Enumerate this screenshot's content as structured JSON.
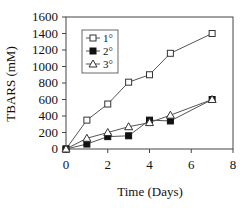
{
  "chart_data": {
    "type": "line",
    "title": "",
    "xlabel": "Time (Days)",
    "ylabel": "TBARS (mM)",
    "xlim": [
      0,
      8
    ],
    "ylim": [
      0,
      1600
    ],
    "xticks": [
      0,
      2,
      4,
      6,
      8
    ],
    "yticks": [
      0,
      200,
      400,
      600,
      800,
      1000,
      1200,
      1400,
      1600
    ],
    "grid": false,
    "legend_position": "upper-left-inside",
    "series": [
      {
        "name": "1°",
        "marker": "open-square",
        "x": [
          0,
          1,
          2,
          3,
          4,
          5,
          7
        ],
        "values": [
          0,
          350,
          545,
          810,
          900,
          1160,
          1400
        ]
      },
      {
        "name": "2°",
        "marker": "filled-square",
        "x": [
          0,
          1,
          2,
          3,
          4,
          5,
          7
        ],
        "values": [
          0,
          60,
          150,
          160,
          350,
          340,
          600
        ]
      },
      {
        "name": "3°",
        "marker": "open-triangle",
        "x": [
          0,
          1,
          2,
          3,
          4,
          5,
          7
        ],
        "values": [
          0,
          130,
          200,
          270,
          320,
          410,
          600
        ]
      }
    ]
  }
}
